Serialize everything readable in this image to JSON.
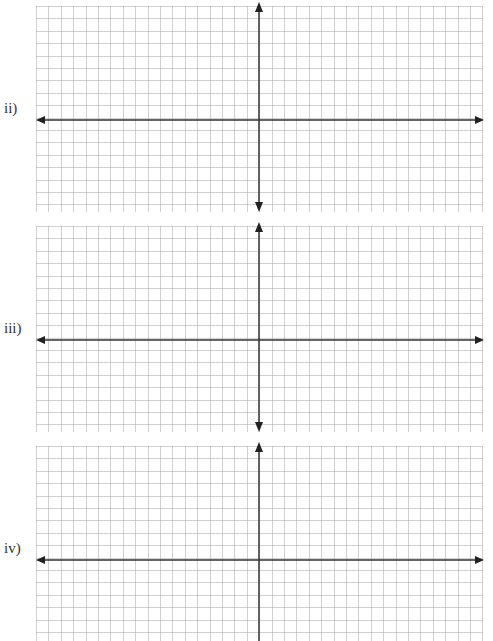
{
  "worksheet": {
    "panels": [
      {
        "label": "ii)",
        "top": 2,
        "height": 210,
        "x_axis_y": 118,
        "y_axis_top_arrow": true,
        "y_axis_bottom_arrow": true
      },
      {
        "label": "iii)",
        "top": 222,
        "height": 210,
        "x_axis_y": 118,
        "y_axis_top_arrow": true,
        "y_axis_bottom_arrow": true
      },
      {
        "label": "iv)",
        "top": 442,
        "height": 199,
        "x_axis_y": 118,
        "y_axis_top_arrow": true,
        "y_axis_bottom_arrow": false
      }
    ],
    "colors": {
      "axis": "#333333",
      "grid": "#aaaaaa",
      "label": "#333333"
    }
  }
}
